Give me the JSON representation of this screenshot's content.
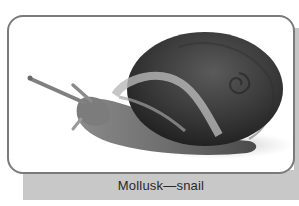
{
  "figure": {
    "image_alt": "Photograph of a garden snail with a coiled shell extending its tentacles",
    "caption": "Mollusk—snail"
  },
  "colors": {
    "frame_border": "#7a7a7a",
    "caption_bar": "#c8c8c8",
    "caption_text": "#2a2a2a"
  }
}
